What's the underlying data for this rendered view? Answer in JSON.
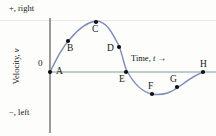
{
  "figure": {
    "title_axes": {
      "positive_direction_label": "+, right",
      "negative_direction_label": "−, left",
      "origin_label": "0",
      "x_axis_label_text": "Time, ",
      "x_axis_label_symbol": "t",
      "x_axis_label_arrow": "→",
      "y_axis_label_text": "Velocity, ",
      "y_axis_label_symbol": "v"
    },
    "colors": {
      "curve": "#7d8cb8",
      "x_axis": "#6f8f92",
      "y_axis": "#4a4a4a",
      "point": "#101010",
      "background": "#fdfdfb",
      "scan_artifact": "#f0dede"
    }
  },
  "chart_data": {
    "type": "line",
    "title": "",
    "xlabel": "Time, t",
    "ylabel": "Velocity, v",
    "grid": false,
    "legend": false,
    "xlim": [
      0,
      1
    ],
    "ylim": [
      -1,
      1
    ],
    "annotations": [
      "+, right",
      "−, left",
      "0",
      "Time, t →",
      "Velocity, v"
    ],
    "points": [
      {
        "label": "A",
        "x": 0.0,
        "y": 0.0,
        "px": 50,
        "py": 72,
        "label_px": 56,
        "label_py": 67
      },
      {
        "label": "B",
        "x": 0.105,
        "y": 0.6,
        "px": 68,
        "py": 41,
        "label_px": 67,
        "label_py": 44
      },
      {
        "label": "C",
        "x": 0.27,
        "y": 0.99,
        "px": 96,
        "py": 22,
        "label_px": 92,
        "label_py": 25
      },
      {
        "label": "D",
        "x": 0.4,
        "y": 0.48,
        "px": 119,
        "py": 47,
        "label_px": 107,
        "label_py": 44
      },
      {
        "label": "E",
        "x": 0.445,
        "y": 0.0,
        "px": 126,
        "py": 72,
        "label_px": 119,
        "label_py": 75
      },
      {
        "label": "F",
        "x": 0.6,
        "y": -0.44,
        "px": 152,
        "py": 94,
        "label_px": 148,
        "label_py": 82
      },
      {
        "label": "G",
        "x": 0.745,
        "y": -0.3,
        "px": 177,
        "py": 87,
        "label_px": 170,
        "label_py": 75
      },
      {
        "label": "H",
        "x": 0.895,
        "y": 0.0,
        "px": 203,
        "py": 72,
        "label_px": 200,
        "label_py": 60
      }
    ],
    "curve_path": "M 50,72 C 58,56 62,48 70,39 C 80,27 88,22 96,21 C 106,21 112,32 119,46 C 123,56 124,66 127,71 C 133,82 141,92 152,94 C 164,96 172,92 180,86 C 188,80 196,74 204,72"
  }
}
